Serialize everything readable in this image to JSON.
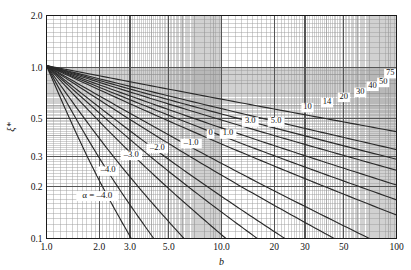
{
  "chart_data": {
    "type": "line",
    "title": "",
    "xlabel": "b",
    "ylabel": "ξ*",
    "xscale": "log",
    "yscale": "log",
    "xlim": [
      1.0,
      100
    ],
    "ylim": [
      0.1,
      2.0
    ],
    "grid": true,
    "minor_grid": true,
    "legend_position": "inline-curve-labels",
    "xticks": [
      {
        "value": 1.0,
        "label": "1.0"
      },
      {
        "value": 2.0,
        "label": "2.0"
      },
      {
        "value": 3.0,
        "label": "3.0"
      },
      {
        "value": 5.0,
        "label": "5.0"
      },
      {
        "value": 10.0,
        "label": "10.0"
      },
      {
        "value": 20,
        "label": "20"
      },
      {
        "value": 30,
        "label": "30"
      },
      {
        "value": 50,
        "label": "50"
      },
      {
        "value": 100,
        "label": "100"
      }
    ],
    "yticks": [
      {
        "value": 2.0,
        "label": "2.0"
      },
      {
        "value": 1.0,
        "label": "1.0"
      },
      {
        "value": 0.5,
        "label": "0.5"
      },
      {
        "value": 0.3,
        "label": "0.3"
      },
      {
        "value": 0.2,
        "label": "0.2"
      },
      {
        "value": 0.1,
        "label": "0.1"
      }
    ],
    "parameter_symbol": "α",
    "alpha_annotation": "α = –4.0",
    "series": [
      {
        "name": "-4.0",
        "alpha": -4.0,
        "label": "–4.0",
        "label_x": 2.25,
        "label_y": 0.243,
        "anchor_x": 1.0,
        "anchor_y": 1.02,
        "end_x": 3.05,
        "end_y": 0.1
      },
      {
        "name": "-3.0",
        "alpha": -3.0,
        "label": "–3.0",
        "label_x": 3.05,
        "label_y": 0.3,
        "anchor_x": 1.0,
        "anchor_y": 1.02,
        "end_x": 4.1,
        "end_y": 0.1
      },
      {
        "name": "-2.0",
        "alpha": -2.0,
        "label": "–2.0",
        "label_x": 4.3,
        "label_y": 0.33,
        "anchor_x": 1.0,
        "anchor_y": 1.02,
        "end_x": 6.1,
        "end_y": 0.1
      },
      {
        "name": "-1.0",
        "alpha": -1.0,
        "label": "–1.0",
        "label_x": 6.7,
        "label_y": 0.352,
        "anchor_x": 1.0,
        "anchor_y": 1.02,
        "end_x": 10.6,
        "end_y": 0.1
      },
      {
        "name": "0",
        "alpha": 0.0,
        "label": "0",
        "label_x": 8.65,
        "label_y": 0.4,
        "anchor_x": 1.0,
        "anchor_y": 1.02,
        "end_x": 16.0,
        "end_y": 0.1
      },
      {
        "name": "1.0",
        "alpha": 1.0,
        "label": "1.0",
        "label_x": 10.9,
        "label_y": 0.4,
        "anchor_x": 1.0,
        "anchor_y": 1.02,
        "end_x": 23.0,
        "end_y": 0.1
      },
      {
        "name": "3.0",
        "alpha": 3.0,
        "label": "3.0",
        "label_x": 14.6,
        "label_y": 0.47,
        "anchor_x": 1.0,
        "anchor_y": 1.02,
        "end_x": 44.0,
        "end_y": 0.1
      },
      {
        "name": "5.0",
        "alpha": 5.0,
        "label": "5.0",
        "label_x": 20.5,
        "label_y": 0.47,
        "anchor_x": 1.0,
        "anchor_y": 1.02,
        "end_x": 70.0,
        "end_y": 0.1
      },
      {
        "name": "10",
        "alpha": 10.0,
        "label": "10",
        "label_x": 31.0,
        "label_y": 0.57,
        "anchor_x": 1.0,
        "anchor_y": 1.02,
        "end_x": 100.0,
        "end_y": 0.137
      },
      {
        "name": "14",
        "alpha": 14.0,
        "label": "14",
        "label_x": 40.0,
        "label_y": 0.61,
        "anchor_x": 1.0,
        "anchor_y": 1.02,
        "end_x": 100.0,
        "end_y": 0.168
      },
      {
        "name": "20",
        "alpha": 20.0,
        "label": "20",
        "label_x": 50.0,
        "label_y": 0.655,
        "anchor_x": 1.0,
        "anchor_y": 1.02,
        "end_x": 100.0,
        "end_y": 0.205
      },
      {
        "name": "30",
        "alpha": 30.0,
        "label": "30",
        "label_x": 62.0,
        "label_y": 0.7,
        "anchor_x": 1.0,
        "anchor_y": 1.02,
        "end_x": 100.0,
        "end_y": 0.25
      },
      {
        "name": "40",
        "alpha": 40.0,
        "label": "40",
        "label_x": 73.0,
        "label_y": 0.76,
        "anchor_x": 1.0,
        "anchor_y": 1.02,
        "end_x": 100.0,
        "end_y": 0.29
      },
      {
        "name": "50",
        "alpha": 50.0,
        "label": "50",
        "label_x": 84.0,
        "label_y": 0.8,
        "anchor_x": 1.0,
        "anchor_y": 1.02,
        "end_x": 100.0,
        "end_y": 0.33
      },
      {
        "name": "75",
        "alpha": 75.0,
        "label": "75",
        "label_x": 92.0,
        "label_y": 0.9,
        "anchor_x": 1.0,
        "anchor_y": 1.02,
        "end_x": 100.0,
        "end_y": 0.42
      }
    ],
    "colors": {
      "background": "#ffffff",
      "axis": "#1a1a1a",
      "major_grid": "#555555",
      "minor_grid": "#9a9a9a",
      "curve": "#2a2a2a",
      "text": "#111111"
    }
  }
}
